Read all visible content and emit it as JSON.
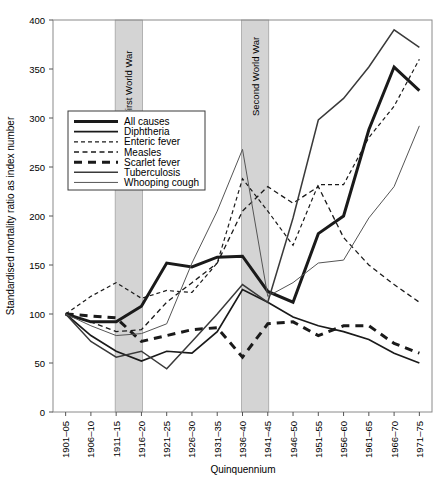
{
  "chart_data": {
    "type": "line",
    "title": "",
    "xlabel": "Quinquennium",
    "ylabel": "Standardised mortality ratio as index number",
    "ylim": [
      0,
      400
    ],
    "yticks": [
      0,
      50,
      100,
      150,
      200,
      250,
      300,
      350,
      400
    ],
    "grid": false,
    "legend_position": "upper-left-inside",
    "categories": [
      "1901–05",
      "1906–10",
      "1911–15",
      "1916–20",
      "1921–25",
      "1926–30",
      "1931–35",
      "1936–40",
      "1941–45",
      "1946–50",
      "1951–55",
      "1956–60",
      "1961–65",
      "1966–70",
      "1971–75"
    ],
    "series": [
      {
        "name": "All causes",
        "style": "thick-solid",
        "color": "#1a1a1a",
        "width": 3.0,
        "values": [
          100,
          92,
          92,
          108,
          152,
          148,
          158,
          159,
          123,
          112,
          182,
          200,
          288,
          352,
          328
        ]
      },
      {
        "name": "Diphtheria",
        "style": "solid",
        "color": "#1a1a1a",
        "width": 1.7,
        "values": [
          100,
          78,
          62,
          52,
          62,
          60,
          82,
          125,
          112,
          97,
          88,
          82,
          74,
          60,
          50
        ]
      },
      {
        "name": "Enteric fever",
        "style": "fine-dash",
        "color": "#1a1a1a",
        "width": 1.2,
        "values": [
          100,
          118,
          132,
          116,
          124,
          122,
          152,
          238,
          205,
          170,
          232,
          232,
          280,
          312,
          360
        ]
      },
      {
        "name": "Measles",
        "style": "dash",
        "color": "#1a1a1a",
        "width": 1.3,
        "values": [
          100,
          92,
          82,
          84,
          112,
          132,
          152,
          205,
          230,
          213,
          230,
          178,
          150,
          130,
          112
        ]
      },
      {
        "name": "Scarlet fever",
        "style": "thick-dash",
        "color": "#1a1a1a",
        "width": 3.0,
        "values": [
          100,
          98,
          96,
          72,
          78,
          84,
          86,
          56,
          90,
          92,
          78,
          88,
          88,
          70,
          60
        ]
      },
      {
        "name": "Tuberculosis",
        "style": "medium-solid",
        "color": "#3a3a3a",
        "width": 1.5,
        "values": [
          100,
          72,
          56,
          62,
          44,
          72,
          100,
          130,
          112,
          198,
          298,
          320,
          352,
          390,
          372
        ]
      },
      {
        "name": "Whooping cough",
        "style": "thin-solid",
        "color": "#555555",
        "width": 1.0,
        "values": [
          100,
          88,
          78,
          80,
          90,
          152,
          205,
          268,
          118,
          132,
          152,
          155,
          198,
          230,
          292
        ]
      }
    ],
    "bands": [
      {
        "label": "First World War",
        "from": "1911–15",
        "to": "1916–20",
        "color": "#d4d4d4"
      },
      {
        "label": "Second World War",
        "from": "1936–40",
        "to": "1941–45",
        "color": "#d4d4d4"
      }
    ]
  },
  "legend": {
    "entries": [
      "All causes",
      "Diphtheria",
      "Enteric fever",
      "Measles",
      "Scarlet fever",
      "Tuberculosis",
      "Whooping cough"
    ]
  }
}
